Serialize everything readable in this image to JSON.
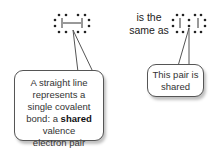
{
  "diagram": {
    "left_structure": {
      "description": "two atoms joined by a straight-line bond, each surrounded by electron dots",
      "bond_symbol": "—"
    },
    "connector_text": {
      "line1": "is the",
      "line2": "same as"
    },
    "right_structure": {
      "description": "two atoms sharing an electron pair shown as two dots between them"
    },
    "callout_left": {
      "line1": "A straight line",
      "line2": "represents a",
      "line3": "single covalent",
      "line4_prefix": "bond: a ",
      "line4_bold": "shared",
      "line5": "valence",
      "line6": "electron pair"
    },
    "callout_right": {
      "line1": "This pair is",
      "line2": "shared"
    },
    "colors": {
      "dot": "#222222",
      "border": "#555555",
      "text": "#333333"
    }
  }
}
